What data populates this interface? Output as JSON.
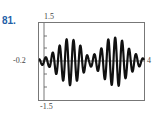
{
  "problem_number": "81.",
  "chart_data": {
    "type": "line",
    "title": "",
    "xlabel": "",
    "ylabel": "",
    "xlim": [
      -0.2,
      4
    ],
    "ylim": [
      -1.5,
      1.5
    ],
    "x_tick_labels": [
      "-0.2",
      "4"
    ],
    "y_tick_labels": [
      "1.5",
      "-1.5"
    ],
    "grid": false,
    "series": [
      {
        "name": "f(x)",
        "x": [
          -0.2,
          0.2,
          0.6,
          1.0,
          1.4,
          1.8,
          2.2,
          2.6,
          3.0,
          3.4,
          3.8,
          4.0
        ],
        "envelope": [
          0.1,
          0.2,
          0.6,
          0.95,
          0.7,
          0.15,
          0.4,
          0.9,
          0.95,
          0.5,
          0.2,
          0.1
        ]
      }
    ]
  }
}
